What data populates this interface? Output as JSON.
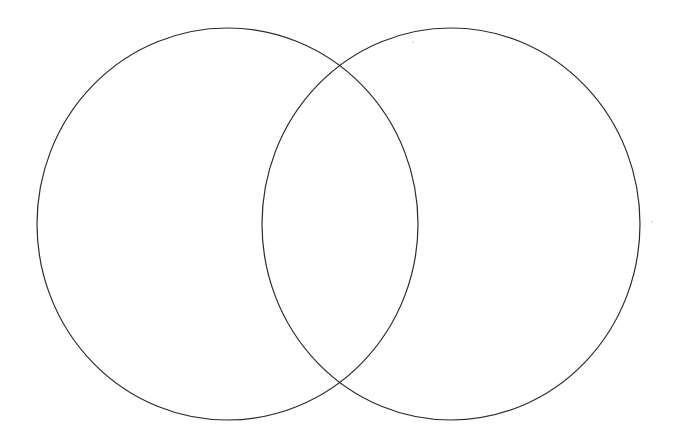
{
  "canvas": {
    "width": 673,
    "height": 438,
    "background": "#ffffff"
  },
  "diagram": {
    "type": "venn",
    "set_count": 2,
    "stroke_color": "#2b2b2b",
    "sets": [
      {
        "id": "left-circle",
        "label": "",
        "cx": 227.5,
        "cy": 224,
        "rx": 190.5,
        "ry": 196
      },
      {
        "id": "right-circle",
        "label": "",
        "cx": 451,
        "cy": 224,
        "rx": 189,
        "ry": 196
      }
    ],
    "intersections": [
      {
        "x": 340,
        "y": 65
      },
      {
        "x": 340,
        "y": 383
      }
    ],
    "labels": []
  }
}
